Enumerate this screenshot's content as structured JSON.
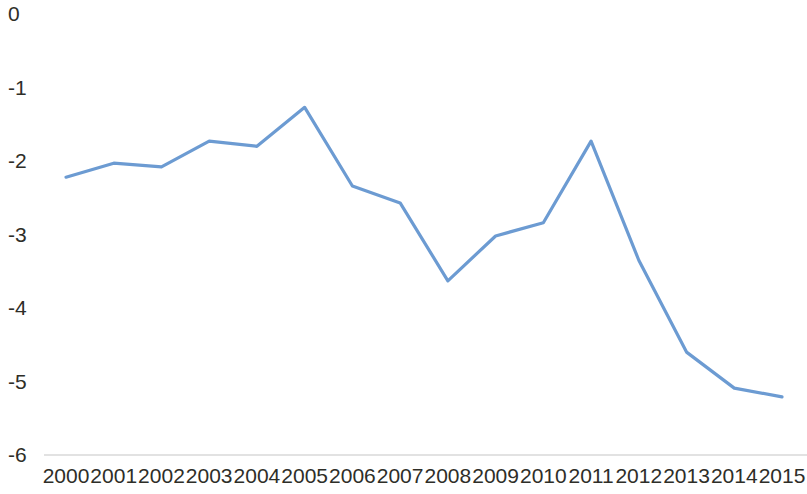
{
  "chart_data": {
    "type": "line",
    "title": "",
    "subtitle": "",
    "xlabel": "",
    "ylabel": "",
    "grid": false,
    "legend": false,
    "legend_position": "none",
    "axis_line_color": "#d9d9d9",
    "series_color": "#6c9bd2",
    "categories": [
      "2000",
      "2001",
      "2002",
      "2003",
      "2004",
      "2005",
      "2006",
      "2007",
      "2008",
      "2009",
      "2010",
      "2011",
      "2012",
      "2013",
      "2014",
      "2015"
    ],
    "x": [
      2000,
      2001,
      2002,
      2003,
      2004,
      2005,
      2006,
      2007,
      2008,
      2009,
      2010,
      2011,
      2012,
      2013,
      2014,
      2015
    ],
    "values": [
      -2.22,
      -2.03,
      -2.08,
      -1.73,
      -1.8,
      -1.27,
      -2.34,
      -2.57,
      -3.63,
      -3.02,
      -2.84,
      -1.73,
      -3.35,
      -4.6,
      -5.09,
      -5.21
    ],
    "series": [
      {
        "name": "series-1",
        "color": "#6c9bd2",
        "values": [
          -2.22,
          -2.03,
          -2.08,
          -1.73,
          -1.8,
          -1.27,
          -2.34,
          -2.57,
          -3.63,
          -3.02,
          -2.84,
          -1.73,
          -3.35,
          -4.6,
          -5.09,
          -5.21
        ]
      }
    ],
    "ylim": [
      -6,
      0
    ],
    "yticks": [
      0,
      -1,
      -2,
      -3,
      -4,
      -5,
      -6
    ],
    "ytick_labels": [
      "0",
      "-1",
      "-2",
      "-3",
      "-4",
      "-5",
      "-6"
    ],
    "xtick_labels": [
      "2000",
      "2001",
      "2002",
      "2003",
      "2004",
      "2005",
      "2006",
      "2007",
      "2008",
      "2009",
      "2010",
      "2011",
      "2012",
      "2013",
      "2014",
      "2015"
    ]
  }
}
